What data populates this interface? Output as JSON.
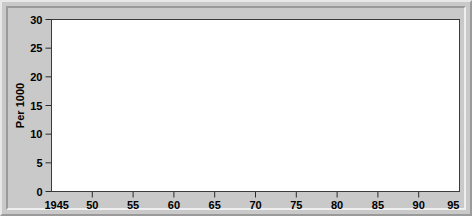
{
  "chart_data": {
    "type": "line",
    "title": "",
    "subtitle": "",
    "xlabel": "",
    "ylabel": "Per 1000",
    "xlim": [
      1945,
      1995
    ],
    "ylim": [
      0,
      30
    ],
    "grid": false,
    "legend_position": "inline-annotations",
    "x_ticks": [
      1945,
      1950,
      1955,
      1960,
      1965,
      1970,
      1975,
      1980,
      1985,
      1990,
      1995
    ],
    "x_tick_labels": [
      "1945",
      "50",
      "55",
      "60",
      "65",
      "70",
      "75",
      "80",
      "85",
      "90",
      "95"
    ],
    "y_ticks": [
      0,
      5,
      10,
      15,
      20,
      25,
      30
    ],
    "y_tick_labels": [
      "0",
      "5",
      "10",
      "15",
      "20",
      "25",
      "30"
    ],
    "annotations": [
      {
        "text": "Canada",
        "group": "birth-rates",
        "x": 1966,
        "y": 28.4
      },
      {
        "text": "US",
        "group": "birth-rates",
        "x": 1962,
        "y": 21.6
      },
      {
        "text": "Birth rates",
        "group": "birth-rates",
        "x": 1955,
        "y": 19.9
      },
      {
        "text": "US",
        "group": "death-rates",
        "x": 1983,
        "y": 10.4
      },
      {
        "text": "Canada",
        "group": "death-rates",
        "x": 1984,
        "y": 6.6
      },
      {
        "text": "Death rates",
        "group": "death-rates",
        "x": 1962,
        "y": 4.4
      }
    ],
    "x": [
      1945,
      1946,
      1947,
      1948,
      1949,
      1950,
      1951,
      1952,
      1953,
      1954,
      1955,
      1956,
      1957,
      1958,
      1959,
      1960,
      1961,
      1962,
      1963,
      1964,
      1965,
      1966,
      1967,
      1968,
      1969,
      1970,
      1971,
      1972,
      1973,
      1974,
      1975,
      1976,
      1977,
      1978,
      1979,
      1980,
      1981,
      1982,
      1983,
      1984,
      1985,
      1986,
      1987,
      1988,
      1989,
      1990,
      1991,
      1992,
      1993,
      1994,
      1995
    ],
    "series": [
      {
        "name": "Canada birth rate",
        "group": "birth-rates",
        "style": "solid",
        "values": [
          24.3,
          24.5,
          28.5,
          27.5,
          27.2,
          27.1,
          27.2,
          27.5,
          27.7,
          27.8,
          27.5,
          27.5,
          28.0,
          27.9,
          27.8,
          27.5,
          27.2,
          27.5,
          28.2,
          27.4,
          25.9,
          23.6,
          21.6,
          19.2,
          18.3,
          17.6,
          17.0,
          16.1,
          15.5,
          15.4,
          15.8,
          15.8,
          15.6,
          15.4,
          15.4,
          15.3,
          15.2,
          15.1,
          15.0,
          14.9,
          14.8,
          14.3,
          14.0,
          13.9,
          13.9,
          13.7,
          13.5,
          13.4,
          13.3,
          13.3,
          13.2
        ]
      },
      {
        "name": "US birth rate",
        "group": "birth-rates",
        "style": "dashed",
        "values": [
          19.0,
          20.8,
          26.0,
          24.0,
          23.6,
          23.7,
          24.0,
          24.3,
          24.4,
          24.5,
          24.5,
          24.6,
          24.6,
          24.2,
          24.2,
          23.9,
          23.8,
          23.8,
          24.0,
          23.7,
          22.4,
          20.7,
          18.4,
          17.5,
          17.8,
          18.4,
          17.2,
          15.6,
          14.9,
          14.8,
          14.6,
          14.6,
          15.1,
          15.0,
          15.3,
          15.9,
          15.8,
          15.9,
          15.6,
          15.5,
          15.7,
          15.5,
          15.7,
          15.9,
          16.2,
          16.7,
          16.3,
          15.9,
          15.5,
          15.2,
          14.8
        ]
      },
      {
        "name": "Canada death rate",
        "group": "death-rates",
        "style": "solid",
        "values": [
          8.8,
          8.7,
          8.7,
          8.7,
          8.7,
          8.7,
          8.6,
          8.4,
          8.1,
          7.9,
          7.9,
          8.0,
          8.0,
          7.9,
          7.7,
          7.6,
          7.6,
          7.6,
          7.6,
          7.6,
          7.5,
          7.5,
          7.4,
          7.4,
          7.4,
          7.3,
          7.3,
          7.3,
          7.3,
          7.2,
          7.1,
          7.1,
          7.1,
          7.0,
          7.0,
          7.0,
          7.0,
          7.0,
          7.0,
          7.1,
          7.1,
          7.1,
          7.1,
          7.1,
          7.1,
          7.1,
          7.1,
          7.1,
          7.1,
          7.1,
          7.2
        ]
      },
      {
        "name": "US death rate",
        "group": "death-rates",
        "style": "dashed",
        "values": [
          10.3,
          10.3,
          10.2,
          10.1,
          10.0,
          9.9,
          9.8,
          9.7,
          9.7,
          9.6,
          9.6,
          9.6,
          9.6,
          9.5,
          9.5,
          9.5,
          9.4,
          9.5,
          9.5,
          9.4,
          9.4,
          9.5,
          9.4,
          9.6,
          9.5,
          9.4,
          9.3,
          9.3,
          9.3,
          9.2,
          8.9,
          8.9,
          8.8,
          8.8,
          8.7,
          8.8,
          8.6,
          8.5,
          8.6,
          8.6,
          8.7,
          8.7,
          8.7,
          8.8,
          8.7,
          8.6,
          8.6,
          8.5,
          8.8,
          8.8,
          8.8
        ]
      }
    ]
  }
}
